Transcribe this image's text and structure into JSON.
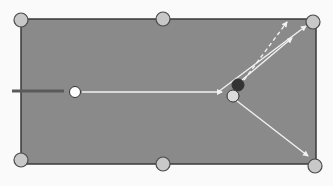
{
  "diagram": {
    "colors": {
      "background": "#fafafa",
      "table_felt": "#8a8a8a",
      "table_border": "#3a3a3a",
      "pocket_fill": "#c8c8c8",
      "pocket_stroke": "#4a4a4a",
      "cue_stick": "#5a5a5a",
      "cue_ball": "#ffffff",
      "object_ball_dark": "#333333",
      "object_ball_light": "#dcdcdc",
      "arrow": "#f2f2f2"
    },
    "table": {
      "x": 21,
      "y": 19,
      "width": 295,
      "height": 145
    },
    "pockets": [
      {
        "name": "top-left",
        "cx": 21,
        "cy": 20
      },
      {
        "name": "top-middle",
        "cx": 163,
        "cy": 19
      },
      {
        "name": "top-right",
        "cx": 313,
        "cy": 22
      },
      {
        "name": "bottom-left",
        "cx": 21,
        "cy": 160
      },
      {
        "name": "bottom-middle",
        "cx": 163,
        "cy": 164
      },
      {
        "name": "bottom-right",
        "cx": 315,
        "cy": 166
      }
    ],
    "cue_stick": {
      "x1": 12,
      "y1": 91,
      "x2": 64,
      "y2": 91
    },
    "balls": [
      {
        "name": "cue-ball",
        "cx": 75,
        "cy": 92,
        "r": 5.5
      },
      {
        "name": "dark-ball",
        "cx": 238,
        "cy": 85,
        "r": 6
      },
      {
        "name": "light-ball",
        "cx": 233,
        "cy": 96,
        "r": 6
      }
    ],
    "paths": [
      {
        "name": "cue-ball-path",
        "x1": 82,
        "y1": 92,
        "x2": 222,
        "y2": 92,
        "dashed": false
      },
      {
        "name": "deflection-path-top",
        "x1": 218,
        "y1": 92,
        "x2": 306,
        "y2": 26,
        "dashed": false
      },
      {
        "name": "aim-line-dashed",
        "x1": 244,
        "y1": 80,
        "x2": 287,
        "y2": 22,
        "dashed": true
      },
      {
        "name": "dark-ball-path",
        "x1": 242,
        "y1": 80,
        "x2": 292,
        "y2": 38,
        "dashed": false
      },
      {
        "name": "light-ball-path",
        "x1": 237,
        "y1": 101,
        "x2": 308,
        "y2": 156,
        "dashed": false
      }
    ]
  }
}
